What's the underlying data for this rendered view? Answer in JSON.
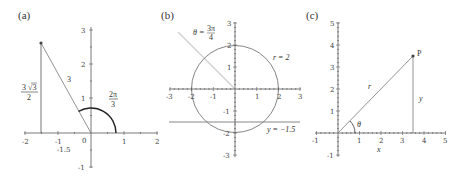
{
  "figure": {
    "panels": [
      {
        "label": "(a)",
        "x_ticks": [
          "-2",
          "-1",
          "0",
          "1",
          "2"
        ],
        "y_ticks": [
          "3",
          "2",
          "1",
          "-1"
        ],
        "extra_tick_label": "-1.5",
        "annotations": {
          "hypotenuse": "3",
          "height_num": "3 √3",
          "height_den": "2",
          "angle_num": "2π",
          "angle_den": "3"
        },
        "point": {
          "x": -1.5,
          "y": 2.598
        },
        "arc_radius": 0.75,
        "angle_rad": "2π/3"
      },
      {
        "label": "(b)",
        "x_ticks": [
          "-3",
          "-2",
          "-1",
          "1",
          "2",
          "3"
        ],
        "y_ticks": [
          "3",
          "2",
          "1",
          "-1",
          "-2",
          "-3"
        ],
        "annotations": {
          "theta_prefix": "θ =",
          "theta_num": "3π",
          "theta_den": "4",
          "circle_label": "r = 2",
          "line_label": "y = −1.5"
        },
        "circle_radius": 2,
        "horizontal_line_y": -1.5,
        "ray_angle": "3π/4"
      },
      {
        "label": "(c)",
        "x_ticks": [
          "-1",
          "1",
          "2",
          "3",
          "4",
          "5"
        ],
        "y_ticks": [
          "5",
          "4",
          "3",
          "2",
          "1",
          "-1"
        ],
        "annotations": {
          "point_label": "P",
          "r_label": "r",
          "y_label": "y",
          "theta_label": "θ",
          "x_axis_label": "x"
        },
        "point": {
          "x": 3.5,
          "y": 3.5
        }
      }
    ],
    "colors": {
      "axis": "#555555",
      "curve": "#333333",
      "light_ray": "#c8c8c8",
      "line": "#777777"
    }
  }
}
